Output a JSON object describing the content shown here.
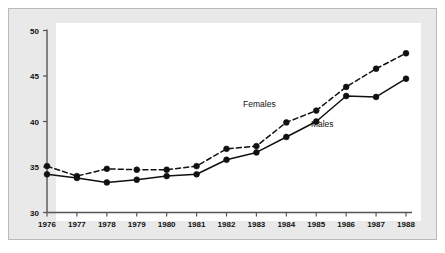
{
  "chart_data": {
    "type": "line",
    "title": "",
    "subtitle": "",
    "xlabel": "",
    "ylabel": "",
    "x": [
      1976,
      1977,
      1978,
      1979,
      1980,
      1981,
      1982,
      1983,
      1984,
      1985,
      1986,
      1987,
      1988
    ],
    "categories": [
      "1976",
      "1977",
      "1978",
      "1979",
      "1980",
      "1981",
      "1982",
      "1983",
      "1984",
      "1985",
      "1986",
      "1987",
      "1988"
    ],
    "series": [
      {
        "name": "Females",
        "style": "dashed",
        "marker": "filled-circle",
        "color": "#111111",
        "values": [
          35.1,
          34.0,
          34.8,
          34.7,
          34.7,
          35.1,
          37.0,
          37.3,
          39.9,
          41.2,
          43.8,
          45.8,
          47.5
        ]
      },
      {
        "name": "Males",
        "style": "solid",
        "marker": "filled-circle",
        "color": "#111111",
        "values": [
          34.2,
          33.8,
          33.3,
          33.6,
          34.0,
          34.2,
          35.8,
          36.6,
          38.3,
          40.0,
          42.8,
          42.7,
          44.7
        ]
      }
    ],
    "xlim": [
      1976,
      1988
    ],
    "ylim": [
      30,
      50
    ],
    "yticks": [
      30,
      35,
      40,
      45,
      50
    ],
    "ytick_labels": [
      "30",
      "35",
      "40",
      "45",
      "50"
    ],
    "xticks": [
      1976,
      1977,
      1978,
      1979,
      1980,
      1981,
      1982,
      1983,
      1984,
      1985,
      1986,
      1987,
      1988
    ],
    "grid": false,
    "legend_position": "inline-annotations",
    "annotations": [
      {
        "text": "Females",
        "x": 1983.1,
        "y": 41.6
      },
      {
        "text": "Males",
        "x": 1985.2,
        "y": 39.4
      }
    ],
    "colors": {
      "figure_background": "#e9e9e9",
      "plot_background": "#ffffff",
      "frame_border": "#b9b9b9",
      "axis": "#555555",
      "ink": "#111111"
    }
  }
}
